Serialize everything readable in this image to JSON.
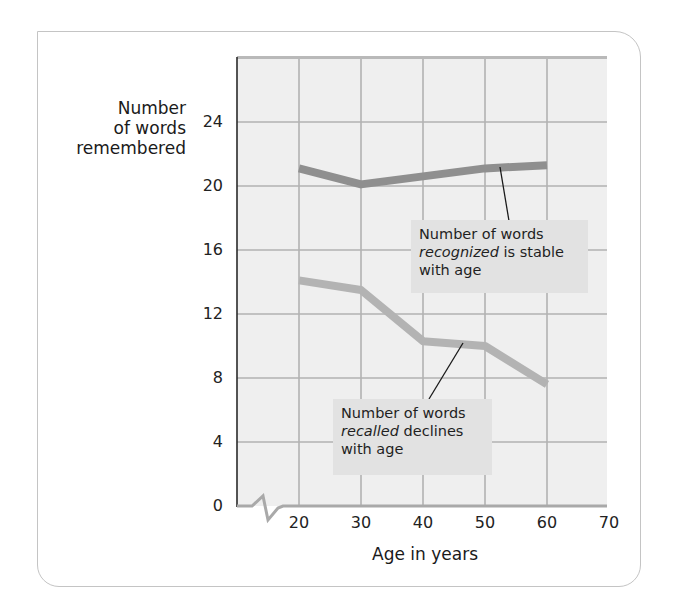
{
  "chart_data": {
    "type": "line",
    "title": "",
    "xlabel": "Age in years",
    "ylabel": "Number of words remembered",
    "ylabel_lines": [
      "Number",
      "of words",
      "remembered"
    ],
    "x": [
      20,
      30,
      40,
      50,
      60
    ],
    "x_ticks": [
      "20",
      "30",
      "40",
      "50",
      "60",
      "70"
    ],
    "y_ticks": [
      "0",
      "4",
      "8",
      "12",
      "16",
      "20",
      "24"
    ],
    "xlim": [
      10,
      70
    ],
    "ylim": [
      0,
      28
    ],
    "grid": true,
    "axis_break": "x-axis between origin and 20",
    "legend": "none (inline annotations)",
    "series": [
      {
        "name": "Number of words recognized",
        "values": [
          21.1,
          20.1,
          20.6,
          21.1,
          21.3
        ],
        "color": "#8f8f8f"
      },
      {
        "name": "Number of words recalled",
        "values": [
          14.1,
          13.5,
          10.3,
          10.0,
          7.6
        ],
        "color": "#b3b3b3"
      }
    ],
    "annotations": [
      {
        "target": "Number of words recognized",
        "line1": "Number of words",
        "emph": "recognized",
        "rest2": " is stable",
        "line3": "with age"
      },
      {
        "target": "Number of words recalled",
        "line1": "Number of words",
        "emph": "recalled",
        "rest2": " declines",
        "line3": "with age"
      }
    ]
  },
  "colors": {
    "plot_background": "#efefef",
    "grid": "#b2b2b2",
    "axis": "#2a2a2a",
    "annotation_fill": "#e2e2e2",
    "frame_border": "#c4c4c4"
  }
}
